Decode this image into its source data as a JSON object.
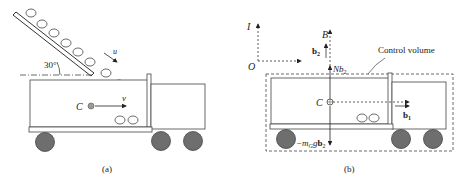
{
  "panel_a": {
    "caption": "(a)",
    "angle_label": "30°",
    "chute_velocity_label": "u",
    "cart_velocity_label": "v",
    "center_label": "C",
    "wheel_color": "#6e6e6e",
    "center_dot_color": "#9a9a9a"
  },
  "panel_b": {
    "caption": "(b)",
    "inertial_frame_label": "I",
    "body_frame_label": "B",
    "origin_label": "O",
    "b2_label": "b",
    "b2_sub": "2",
    "normal_force_label": "Nb",
    "normal_force_sub": "2",
    "center_label": "C",
    "b1_label": "b",
    "b1_sub": "1",
    "weight_label_prefix": "−m",
    "weight_label_sub": "G",
    "weight_label_mid": "g",
    "weight_label_vec": "b",
    "weight_label_vec_sub": "2",
    "control_volume_label": "Control volume"
  }
}
